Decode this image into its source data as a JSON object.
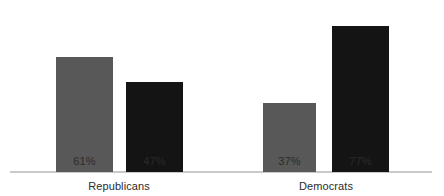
{
  "chart_data": {
    "type": "bar",
    "title": "",
    "subtitle": "",
    "xlabel": "",
    "ylabel": "",
    "ylim": [
      0,
      100
    ],
    "grid": false,
    "legend": "none",
    "categories": [
      "Republicans",
      "Democrats"
    ],
    "series": [
      {
        "name": "series-1",
        "color": "#585858",
        "values": [
          61,
          37
        ],
        "labels": [
          "61%",
          "37%"
        ]
      },
      {
        "name": "series-2",
        "color": "#141414",
        "values": [
          47,
          77
        ],
        "labels": [
          "47%",
          "77%"
        ]
      }
    ],
    "axis_color": "#c9c9c9",
    "background": "#ffffff",
    "value_label_suffix": "%"
  },
  "bars": [
    {
      "group": "Republicans",
      "series": "series-1",
      "value": 61,
      "label": "61%",
      "color": "#585858",
      "left": 56,
      "width": 57,
      "height": 115
    },
    {
      "group": "Republicans",
      "series": "series-2",
      "value": 47,
      "label": "47%",
      "color": "#141414",
      "left": 126,
      "width": 57,
      "height": 90
    },
    {
      "group": "Democrats",
      "series": "series-1",
      "value": 37,
      "label": "37%",
      "color": "#585858",
      "left": 263,
      "width": 53,
      "height": 69
    },
    {
      "group": "Democrats",
      "series": "series-2",
      "value": 77,
      "label": "77%",
      "color": "#141414",
      "left": 332,
      "width": 57,
      "height": 146
    }
  ],
  "category_positions": [
    {
      "label": "Republicans",
      "center": 119
    },
    {
      "label": "Democrats",
      "center": 326
    }
  ]
}
